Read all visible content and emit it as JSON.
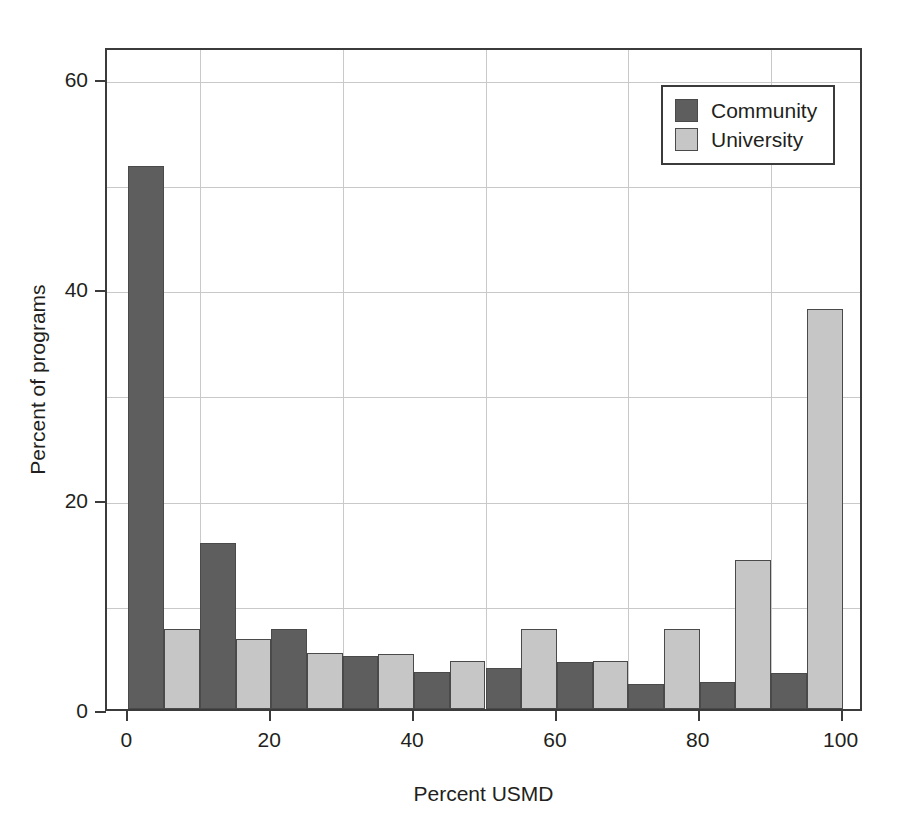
{
  "chart_data": {
    "type": "bar",
    "title": "",
    "xlabel": "Percent USMD",
    "ylabel": "Percent of programs",
    "xlim": [
      -3,
      103
    ],
    "ylim": [
      0,
      63
    ],
    "xticks": [
      0,
      20,
      40,
      60,
      80,
      100
    ],
    "yticks": [
      0,
      20,
      40,
      60
    ],
    "xtick_labels": [
      "0",
      "20",
      "40",
      "60",
      "80",
      "100"
    ],
    "ytick_labels": [
      "0",
      "20",
      "40",
      "60"
    ],
    "grid": true,
    "grid_x_values": [
      10,
      30,
      50,
      70,
      90
    ],
    "grid_y_values": [
      10,
      20,
      30,
      40,
      50,
      60
    ],
    "legend_position": "top-right",
    "bin_edges": [
      0,
      10,
      20,
      30,
      40,
      50,
      60,
      70,
      80,
      90,
      100
    ],
    "categories": [
      "0-10",
      "10-20",
      "20-30",
      "30-40",
      "40-50",
      "50-60",
      "60-70",
      "70-80",
      "80-90",
      "90-100"
    ],
    "series": [
      {
        "name": "Community",
        "color": "#5e5e5e",
        "values": [
          51.6,
          15.8,
          7.6,
          5.0,
          3.5,
          3.9,
          4.5,
          2.4,
          2.6,
          3.4
        ]
      },
      {
        "name": "University",
        "color": "#c6c6c6",
        "values": [
          7.6,
          6.7,
          5.3,
          5.2,
          4.6,
          7.6,
          4.6,
          7.6,
          14.2,
          38.0
        ]
      }
    ]
  },
  "legend": {
    "entries": [
      {
        "label": "Community",
        "swatch": "community-swatch"
      },
      {
        "label": "University",
        "swatch": "university-swatch"
      }
    ]
  }
}
